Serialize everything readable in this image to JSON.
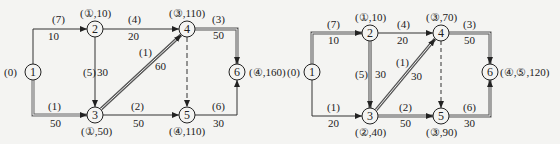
{
  "diagrams": [
    {
      "id": "left",
      "nodes": [
        {
          "id": "1",
          "label": "1",
          "mark": "(0)"
        },
        {
          "id": "2",
          "label": "2",
          "mark": "(①,10)"
        },
        {
          "id": "3",
          "label": "3",
          "mark": "(①,50)"
        },
        {
          "id": "4",
          "label": "4",
          "mark": "(③,110)"
        },
        {
          "id": "5",
          "label": "5",
          "mark": "(④,110)"
        },
        {
          "id": "6",
          "label": "6",
          "mark": "(④,160)"
        }
      ],
      "edges": [
        {
          "from": "1",
          "to": "2",
          "flow": "(7)",
          "cost": "10",
          "style": "single"
        },
        {
          "from": "1",
          "to": "3",
          "flow": "(1)",
          "cost": "50",
          "style": "path"
        },
        {
          "from": "2",
          "to": "4",
          "flow": "(4)",
          "cost": "20",
          "style": "single"
        },
        {
          "from": "2",
          "to": "3",
          "flow": "(5)",
          "cost": "30",
          "style": "single"
        },
        {
          "from": "3",
          "to": "4",
          "flow": "(1)",
          "cost": "60",
          "style": "path"
        },
        {
          "from": "3",
          "to": "5",
          "flow": "(2)",
          "cost": "50",
          "style": "single"
        },
        {
          "from": "4",
          "to": "6",
          "flow": "(3)",
          "cost": "50",
          "style": "path"
        },
        {
          "from": "4",
          "to": "5",
          "flow": "",
          "cost": "",
          "style": "dashed"
        },
        {
          "from": "5",
          "to": "6",
          "flow": "(6)",
          "cost": "30",
          "style": "single"
        }
      ]
    },
    {
      "id": "right",
      "nodes": [
        {
          "id": "1",
          "label": "1",
          "mark": "(0)"
        },
        {
          "id": "2",
          "label": "2",
          "mark": "(①,10)"
        },
        {
          "id": "3",
          "label": "3",
          "mark": "(②,40)"
        },
        {
          "id": "4",
          "label": "4",
          "mark": "(③,70)"
        },
        {
          "id": "5",
          "label": "5",
          "mark": "(③,90)"
        },
        {
          "id": "6",
          "label": "6",
          "mark": "(④,⑤,120)"
        }
      ],
      "edges": [
        {
          "from": "1",
          "to": "2",
          "flow": "(7)",
          "cost": "10",
          "style": "path"
        },
        {
          "from": "1",
          "to": "3",
          "flow": "(1)",
          "cost": "20",
          "style": "single"
        },
        {
          "from": "2",
          "to": "4",
          "flow": "(4)",
          "cost": "20",
          "style": "single"
        },
        {
          "from": "2",
          "to": "3",
          "flow": "(5)",
          "cost": "30",
          "style": "path"
        },
        {
          "from": "3",
          "to": "4",
          "flow": "(1)",
          "cost": "30",
          "style": "path"
        },
        {
          "from": "3",
          "to": "5",
          "flow": "(2)",
          "cost": "50",
          "style": "path"
        },
        {
          "from": "4",
          "to": "6",
          "flow": "(3)",
          "cost": "50",
          "style": "path"
        },
        {
          "from": "4",
          "to": "5",
          "flow": "",
          "cost": "",
          "style": "dashed"
        },
        {
          "from": "5",
          "to": "6",
          "flow": "(6)",
          "cost": "30",
          "style": "path"
        }
      ]
    }
  ]
}
